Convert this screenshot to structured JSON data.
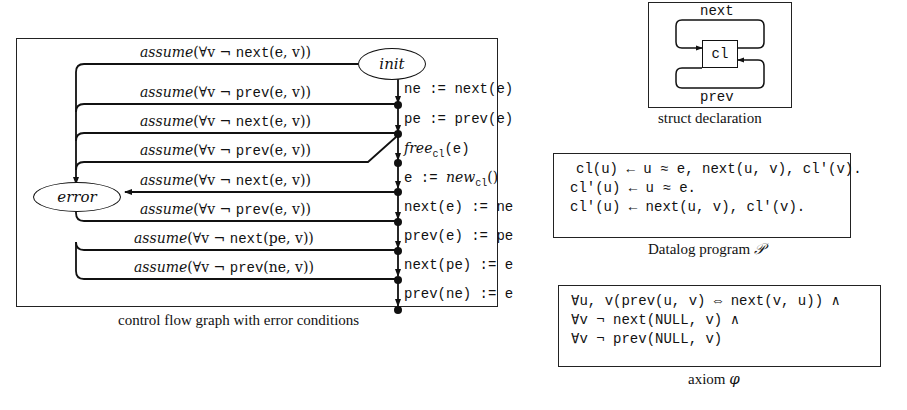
{
  "cfg_panel": {
    "caption": "control flow graph with error conditions",
    "nodes": {
      "init": "init",
      "error": "error"
    },
    "edges": [
      {
        "kw": "assume",
        "pre": "(∀v ¬ ",
        "fn": "next",
        "args": "(e, v))"
      },
      {
        "kw": "assume",
        "pre": "(∀v ¬ ",
        "fn": "prev",
        "args": "(e, v))"
      },
      {
        "kw": "assume",
        "pre": "(∀v ¬ ",
        "fn": "next",
        "args": "(e, v))"
      },
      {
        "kw": "assume",
        "pre": "(∀v ¬ ",
        "fn": "prev",
        "args": "(e, v))"
      },
      {
        "kw": "assume",
        "pre": "(∀v ¬ ",
        "fn": "next",
        "args": "(e, v))"
      },
      {
        "kw": "assume",
        "pre": "(∀v ¬ ",
        "fn": "prev",
        "args": "(e, v))"
      },
      {
        "kw": "assume",
        "pre": "(∀v ¬ ",
        "fn": "next",
        "args": "(pe, v))"
      },
      {
        "kw": "assume",
        "pre": "(∀v ¬ ",
        "fn": "prev",
        "args": "(ne, v))"
      }
    ],
    "statements": [
      "ne := next(e)",
      "pe := prev(e)",
      "free_cl(e)",
      "e := new_cl()",
      "next(e) := ne",
      "prev(e) := pe",
      "next(pe) := e",
      "prev(ne) := e"
    ],
    "statement_parts": {
      "free_name": "free",
      "free_sub": "cl",
      "free_arg": "(e)",
      "new_lhs": "e := ",
      "new_name": "new",
      "new_sub": "cl",
      "new_arg": "()"
    }
  },
  "struct_panel": {
    "caption": "struct declaration",
    "node": "cl",
    "top_field": "next",
    "bottom_field": "prev"
  },
  "datalog_panel": {
    "caption_text": "Datalog program ",
    "caption_symbol": "𝒫",
    "rules": [
      "cl(u) ← u ≈ e, next(u, v), cl′(v).",
      "cl′(u) ← u ≈ e.",
      "cl′(u) ← next(u, v), cl′(v)."
    ]
  },
  "axiom_panel": {
    "caption_text": "axiom ",
    "caption_symbol": "φ",
    "lines": [
      "∀u, v(prev(u, v) ⇔ next(v, u)) ∧",
      "∀v ¬ next(NULL, v) ∧",
      "∀v ¬ prev(NULL, v)"
    ]
  },
  "colors": {
    "ink": "#111111",
    "background": "#ffffff"
  }
}
